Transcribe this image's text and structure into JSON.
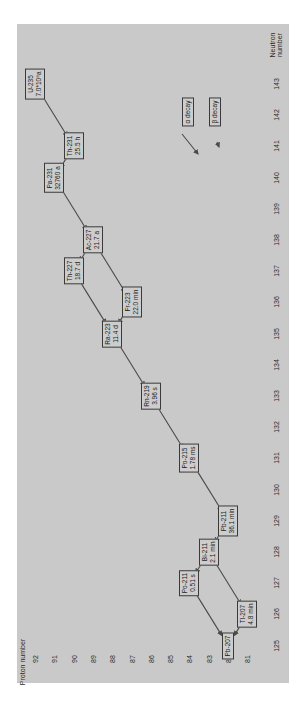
{
  "axes": {
    "proton_label": "Proton number",
    "neutron_label_line1": "Neutron",
    "neutron_label_line2": "number",
    "proton_ticks": [
      "92",
      "91",
      "90",
      "89",
      "88",
      "87",
      "86",
      "85",
      "84",
      "83",
      "82",
      "81"
    ],
    "neutron_ticks": [
      "143",
      "142",
      "141",
      "140",
      "139",
      "138",
      "137",
      "136",
      "135",
      "134",
      "133",
      "132",
      "131",
      "130",
      "129",
      "128",
      "127",
      "126",
      "125"
    ]
  },
  "legend": {
    "alpha": "α decay",
    "beta": "β decay"
  },
  "nuclides": [
    {
      "id": "U-235",
      "name": "U-235",
      "half_life": "7.0*10⁸a",
      "Z": 92,
      "N": 143
    },
    {
      "id": "Th-231",
      "name": "Th-231",
      "half_life": "25.5 h",
      "Z": 90,
      "N": 141
    },
    {
      "id": "Pa-231",
      "name": "Pa-231",
      "half_life": "32760 a",
      "Z": 91,
      "N": 140
    },
    {
      "id": "Ac-227",
      "name": "Ac-227",
      "half_life": "21.7 a",
      "Z": 89,
      "N": 138
    },
    {
      "id": "Th-227",
      "name": "Th-227",
      "half_life": "18.7 d",
      "Z": 90,
      "N": 137
    },
    {
      "id": "Fr-223",
      "name": "Fr-223",
      "half_life": "22.0 min",
      "Z": 87,
      "N": 136
    },
    {
      "id": "Ra-223",
      "name": "Ra-223",
      "half_life": "11.4 d",
      "Z": 88,
      "N": 135
    },
    {
      "id": "Rn-219",
      "name": "Rn-219",
      "half_life": "3.96 s",
      "Z": 86,
      "N": 133
    },
    {
      "id": "Po-215",
      "name": "Po-215",
      "half_life": "1.78 ms",
      "Z": 84,
      "N": 131
    },
    {
      "id": "Pb-211",
      "name": "Pb-211",
      "half_life": "36.1 min",
      "Z": 82,
      "N": 129
    },
    {
      "id": "Bi-211",
      "name": "Bi-211",
      "half_life": "2.1 min",
      "Z": 83,
      "N": 128
    },
    {
      "id": "Po-211",
      "name": "Po-211",
      "half_life": "0.51 s",
      "Z": 84,
      "N": 127
    },
    {
      "id": "Tl-207",
      "name": "Tl-207",
      "half_life": "4.8 min",
      "Z": 81,
      "N": 126
    },
    {
      "id": "Pb-207",
      "name": "Pb-207",
      "half_life": "",
      "Z": 82,
      "N": 125
    }
  ],
  "decays": [
    {
      "from": "U-235",
      "to": "Th-231",
      "type": "alpha"
    },
    {
      "from": "Th-231",
      "to": "Pa-231",
      "type": "beta"
    },
    {
      "from": "Pa-231",
      "to": "Ac-227",
      "type": "alpha"
    },
    {
      "from": "Ac-227",
      "to": "Th-227",
      "type": "beta"
    },
    {
      "from": "Ac-227",
      "to": "Fr-223",
      "type": "alpha"
    },
    {
      "from": "Th-227",
      "to": "Ra-223",
      "type": "alpha"
    },
    {
      "from": "Fr-223",
      "to": "Ra-223",
      "type": "beta"
    },
    {
      "from": "Ra-223",
      "to": "Rn-219",
      "type": "alpha"
    },
    {
      "from": "Rn-219",
      "to": "Po-215",
      "type": "alpha"
    },
    {
      "from": "Po-215",
      "to": "Pb-211",
      "type": "alpha"
    },
    {
      "from": "Pb-211",
      "to": "Bi-211",
      "type": "beta"
    },
    {
      "from": "Bi-211",
      "to": "Po-211",
      "type": "beta"
    },
    {
      "from": "Bi-211",
      "to": "Tl-207",
      "type": "alpha"
    },
    {
      "from": "Po-211",
      "to": "Pb-207",
      "type": "alpha"
    },
    {
      "from": "Tl-207",
      "to": "Pb-207",
      "type": "beta"
    }
  ],
  "colors": {
    "panel": "#c9c9c9",
    "line": "#4a4a4a",
    "text": "#1c1c1c"
  }
}
